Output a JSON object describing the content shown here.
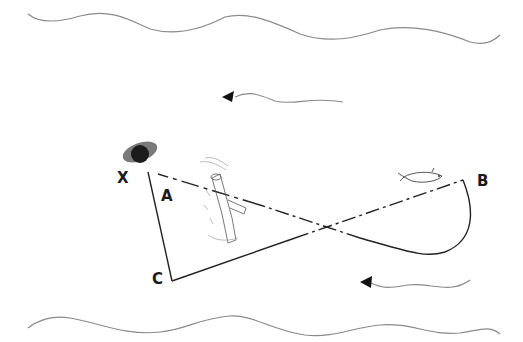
{
  "diagram": {
    "labels": {
      "x": "X",
      "a": "A",
      "b": "B",
      "c": "C"
    },
    "elements": {
      "top_bank": "river-bank-top",
      "bottom_bank": "river-bank-bottom",
      "current_arrow_top": "current-arrow-left",
      "current_arrow_bottom": "current-arrow-left",
      "marker_x": "anchor-buoy",
      "snag": "submerged-log",
      "fish": "fish"
    },
    "colors": {
      "line": "#222222",
      "bank": "#8a8a8a",
      "buoy_dark": "#1c1c1c",
      "buoy_light": "#7a7a7a"
    }
  }
}
